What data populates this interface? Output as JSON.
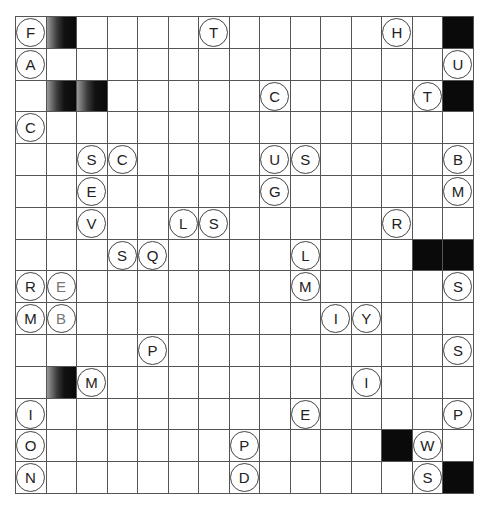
{
  "puzzle": {
    "rows": 15,
    "cols": 15,
    "black_cells": [
      [
        0,
        14
      ],
      [
        2,
        14
      ],
      [
        7,
        13
      ],
      [
        7,
        14
      ],
      [
        13,
        12
      ],
      [
        14,
        14
      ]
    ],
    "shaded_cells": [
      [
        0,
        1
      ],
      [
        2,
        1
      ],
      [
        2,
        2
      ],
      [
        11,
        1
      ]
    ],
    "letters": [
      {
        "r": 0,
        "c": 0,
        "ch": "F"
      },
      {
        "r": 0,
        "c": 6,
        "ch": "T"
      },
      {
        "r": 0,
        "c": 12,
        "ch": "H"
      },
      {
        "r": 1,
        "c": 0,
        "ch": "A"
      },
      {
        "r": 1,
        "c": 14,
        "ch": "U"
      },
      {
        "r": 2,
        "c": 8,
        "ch": "C"
      },
      {
        "r": 2,
        "c": 13,
        "ch": "T"
      },
      {
        "r": 3,
        "c": 0,
        "ch": "C"
      },
      {
        "r": 4,
        "c": 2,
        "ch": "S"
      },
      {
        "r": 4,
        "c": 3,
        "ch": "C"
      },
      {
        "r": 4,
        "c": 8,
        "ch": "U"
      },
      {
        "r": 4,
        "c": 9,
        "ch": "S"
      },
      {
        "r": 4,
        "c": 14,
        "ch": "B"
      },
      {
        "r": 5,
        "c": 2,
        "ch": "E"
      },
      {
        "r": 5,
        "c": 8,
        "ch": "G"
      },
      {
        "r": 5,
        "c": 14,
        "ch": "M"
      },
      {
        "r": 6,
        "c": 2,
        "ch": "V"
      },
      {
        "r": 6,
        "c": 5,
        "ch": "L"
      },
      {
        "r": 6,
        "c": 6,
        "ch": "S"
      },
      {
        "r": 6,
        "c": 12,
        "ch": "R"
      },
      {
        "r": 7,
        "c": 3,
        "ch": "S"
      },
      {
        "r": 7,
        "c": 4,
        "ch": "Q"
      },
      {
        "r": 7,
        "c": 9,
        "ch": "L"
      },
      {
        "r": 8,
        "c": 0,
        "ch": "R"
      },
      {
        "r": 8,
        "c": 1,
        "ch": "E",
        "faded": true
      },
      {
        "r": 8,
        "c": 9,
        "ch": "M"
      },
      {
        "r": 8,
        "c": 14,
        "ch": "S"
      },
      {
        "r": 9,
        "c": 0,
        "ch": "M"
      },
      {
        "r": 9,
        "c": 1,
        "ch": "B",
        "faded": true
      },
      {
        "r": 9,
        "c": 10,
        "ch": "I"
      },
      {
        "r": 9,
        "c": 11,
        "ch": "Y"
      },
      {
        "r": 10,
        "c": 4,
        "ch": "P"
      },
      {
        "r": 10,
        "c": 14,
        "ch": "S"
      },
      {
        "r": 11,
        "c": 2,
        "ch": "M"
      },
      {
        "r": 11,
        "c": 11,
        "ch": "I"
      },
      {
        "r": 12,
        "c": 0,
        "ch": "I"
      },
      {
        "r": 12,
        "c": 9,
        "ch": "E"
      },
      {
        "r": 12,
        "c": 14,
        "ch": "P"
      },
      {
        "r": 13,
        "c": 0,
        "ch": "O"
      },
      {
        "r": 13,
        "c": 7,
        "ch": "P"
      },
      {
        "r": 13,
        "c": 13,
        "ch": "W"
      },
      {
        "r": 14,
        "c": 0,
        "ch": "N"
      },
      {
        "r": 14,
        "c": 7,
        "ch": "D"
      },
      {
        "r": 14,
        "c": 13,
        "ch": "S"
      }
    ]
  }
}
